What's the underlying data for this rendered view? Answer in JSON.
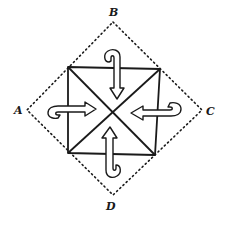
{
  "diagram": {
    "labels": {
      "top": "B",
      "left": "A",
      "right": "C",
      "bottom": "D"
    },
    "shapes": {
      "outer_diamond": {
        "style": "dotted",
        "vertices": [
          "B",
          "C",
          "D",
          "A"
        ]
      },
      "inner_square": {
        "style": "solid",
        "diagonals": true
      },
      "arrows": [
        {
          "from": "top",
          "direction": "down",
          "type": "fold-over"
        },
        {
          "from": "left",
          "direction": "right",
          "type": "fold-over"
        },
        {
          "from": "right",
          "direction": "left",
          "type": "fold-over"
        },
        {
          "from": "bottom",
          "direction": "up",
          "type": "fold-over"
        }
      ]
    },
    "colors": {
      "line": "#1a1a1a",
      "background": "#ffffff"
    }
  }
}
